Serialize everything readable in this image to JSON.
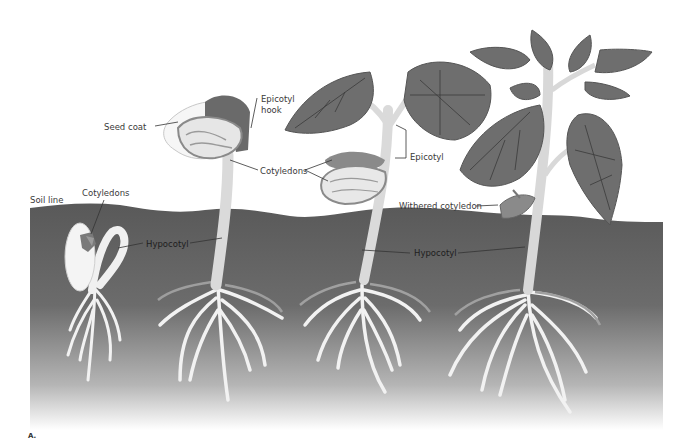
{
  "figure": {
    "panel_letter": "A.",
    "colors": {
      "soil_top": "#5a5a5a",
      "soil_bottom": "#ffffff",
      "leaf_fill": "#6e6e6e",
      "leaf_vein": "#333333",
      "stem": "#dcdcdc",
      "root": "#f2f2f2",
      "cotyledon": "#8a8a8a",
      "seed_coat": "#f4f4f4"
    }
  },
  "labels": {
    "soil_line": "Soil line",
    "cotyledons_1": "Cotyledons",
    "hypocotyl_1": "Hypocotyl",
    "seed_coat": "Seed coat",
    "epicotyl_hook_1": "Epicotyl",
    "epicotyl_hook_2": "hook",
    "cotyledons_2": "Cotyledons",
    "epicotyl": "Epicotyl",
    "withered_cotyledon": "Withered cotyledon",
    "hypocotyl_2": "Hypocotyl"
  },
  "stages": [
    {
      "stage": 1,
      "structures": [
        "Cotyledons",
        "Hypocotyl"
      ]
    },
    {
      "stage": 2,
      "structures": [
        "Seed coat",
        "Epicotyl hook",
        "Cotyledons",
        "Hypocotyl"
      ]
    },
    {
      "stage": 3,
      "structures": [
        "Cotyledons",
        "Epicotyl",
        "Hypocotyl"
      ]
    },
    {
      "stage": 4,
      "structures": [
        "Withered cotyledon",
        "Hypocotyl"
      ]
    }
  ]
}
